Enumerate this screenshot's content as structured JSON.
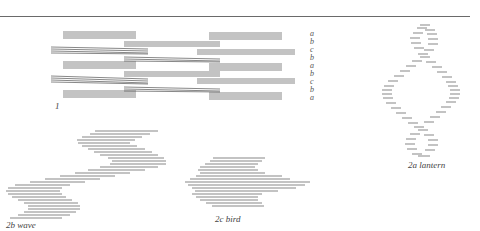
{
  "figure": {
    "labels": {
      "fig1": "1",
      "fig2a": "2a lantern",
      "fig2b": "2b wave",
      "fig2c": "2c bird"
    },
    "side_letters": [
      "a",
      "b",
      "c",
      "b",
      "a",
      "b",
      "c",
      "b",
      "a"
    ],
    "line_color": "#555555",
    "rule_color": "#6a6a6a"
  }
}
